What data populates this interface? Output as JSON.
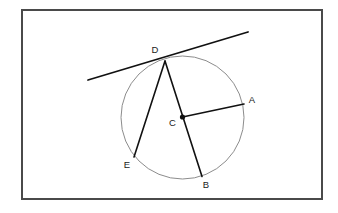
{
  "figure": {
    "canvas": {
      "width": 338,
      "height": 213,
      "background": "#ffffff"
    },
    "frame": {
      "name": "outer-border",
      "x": 22,
      "y": 10,
      "width": 300,
      "height": 189,
      "stroke": "#4a4a4a",
      "stroke_width": 2.0,
      "fill": "#ffffff"
    },
    "circle": {
      "name": "main-circle",
      "cx": 182.5,
      "cy": 117.5,
      "r": 61.5,
      "stroke": "#8c8c8c",
      "stroke_width": 1.0,
      "fill": "none"
    },
    "center_dot": {
      "name": "center-point-marker",
      "cx": 182.5,
      "cy": 117.0,
      "r": 2.6,
      "fill": "#111111"
    },
    "points": [
      {
        "id": "A",
        "label": "A",
        "x": 244.0,
        "y": 104.0,
        "label_x": 252.0,
        "label_y": 100.0,
        "on_circle": true
      },
      {
        "id": "B",
        "label": "B",
        "x": 202.0,
        "y": 176.5,
        "label_x": 206.0,
        "label_y": 185.0,
        "on_circle": true
      },
      {
        "id": "C",
        "label": "C",
        "x": 182.5,
        "y": 117.0,
        "label_x": 172.5,
        "label_y": 123.0,
        "on_circle": false
      },
      {
        "id": "D",
        "label": "D",
        "x": 165.0,
        "y": 61.0,
        "label_x": 155.0,
        "label_y": 50.0,
        "on_circle": true
      },
      {
        "id": "E",
        "label": "E",
        "x": 134.0,
        "y": 157.0,
        "label_x": 127.0,
        "label_y": 165.0,
        "on_circle": true
      }
    ],
    "segments": [
      {
        "name": "segment-C-A",
        "from": "C",
        "to": "A",
        "x1": 182.5,
        "y1": 117.0,
        "x2": 244.0,
        "y2": 104.0,
        "stroke": "#111111",
        "stroke_width": 1.6,
        "kind": "radius"
      },
      {
        "name": "segment-D-B",
        "from": "D",
        "to": "B",
        "x1": 165.0,
        "y1": 61.0,
        "x2": 202.0,
        "y2": 176.5,
        "stroke": "#111111",
        "stroke_width": 1.6,
        "kind": "diameter-through-C"
      },
      {
        "name": "segment-D-E",
        "from": "D",
        "to": "E",
        "x1": 165.0,
        "y1": 61.0,
        "x2": 134.0,
        "y2": 157.0,
        "stroke": "#111111",
        "stroke_width": 1.6,
        "kind": "chord"
      }
    ],
    "tangent_line": {
      "name": "tangent-line-at-D",
      "x1": 88.0,
      "y1": 80.0,
      "x2": 248.0,
      "y2": 32.0,
      "stroke": "#111111",
      "stroke_width": 1.8,
      "touches_point": "D"
    }
  }
}
